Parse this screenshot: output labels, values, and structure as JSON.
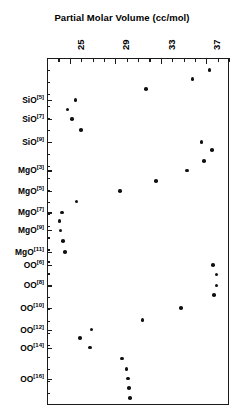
{
  "chart_data": {
    "type": "scatter",
    "title": "Partial Molar Volume (cc/mol)",
    "xlabel": "Partial Molar Volume (cc/mol)",
    "ylabel": "",
    "orientation": "horizontal",
    "xlim": [
      23,
      39
    ],
    "xticks": [
      25,
      29,
      33,
      37
    ],
    "xtick_labels": [
      "25",
      "29",
      "33",
      "37"
    ],
    "xminor_step": 1,
    "grid": false,
    "legend": null,
    "axis_title_position": "top",
    "categories": [
      "SiO[5]",
      "SiO[7]",
      "SiO[9]",
      "MgO[3]",
      "MgO[5]",
      "MgO[7]",
      "MgO[9]",
      "MgO[11]",
      "OO[6]",
      "OO[8]",
      "OO[10]",
      "OO[12]",
      "OO[14]",
      "OO[16]"
    ],
    "category_labels": [
      {
        "base": "SiO",
        "sup": "[5]"
      },
      {
        "base": "SiO",
        "sup": "[7]"
      },
      {
        "base": "SiO",
        "sup": "[9]"
      },
      {
        "base": "MgO",
        "sup": "[3]"
      },
      {
        "base": "MgO",
        "sup": "[5]"
      },
      {
        "base": "MgO",
        "sup": "[7]"
      },
      {
        "base": "MgO",
        "sup": "[9]"
      },
      {
        "base": "MgO",
        "sup": "[11]"
      },
      {
        "base": "OO",
        "sup": "[6]"
      },
      {
        "base": "OO",
        "sup": "[8]"
      },
      {
        "base": "OO",
        "sup": "[10]"
      },
      {
        "base": "OO",
        "sup": "[12]"
      },
      {
        "base": "OO",
        "sup": "[14]"
      },
      {
        "base": "OO",
        "sup": "[16]"
      }
    ],
    "points": [
      {
        "category": "",
        "row": 0,
        "value": 37.3
      },
      {
        "category": "",
        "row": 0.75,
        "value": 35.8
      },
      {
        "category": "",
        "row": 1.6,
        "value": 31.7
      },
      {
        "category": "SiO[5]",
        "row": 2.5,
        "value": 25.5
      },
      {
        "category": "",
        "row": 3.3,
        "value": 24.8
      },
      {
        "category": "SiO[7]",
        "row": 4.1,
        "value": 25.2
      },
      {
        "category": "",
        "row": 5.0,
        "value": 26.0
      },
      {
        "category": "SiO[9]",
        "row": 6.0,
        "value": 36.6
      },
      {
        "category": "",
        "row": 6.7,
        "value": 37.5
      },
      {
        "category": "",
        "row": 7.6,
        "value": 36.8
      },
      {
        "category": "MgO[3]",
        "row": 8.4,
        "value": 35.3
      },
      {
        "category": "",
        "row": 9.3,
        "value": 32.6
      },
      {
        "category": "MgO[5]",
        "row": 10.1,
        "value": 29.4
      },
      {
        "category": "",
        "row": 11.0,
        "value": 25.6
      },
      {
        "category": "MgO[7]",
        "row": 11.9,
        "value": 24.3
      },
      {
        "category": "",
        "row": 12.6,
        "value": 24.1
      },
      {
        "category": "MgO[9]",
        "row": 13.4,
        "value": 24.2
      },
      {
        "category": "",
        "row": 14.3,
        "value": 24.4
      },
      {
        "category": "MgO[11]",
        "row": 15.2,
        "value": 24.6
      },
      {
        "category": "OO[6]",
        "row": 16.3,
        "value": 37.6
      },
      {
        "category": "",
        "row": 17.1,
        "value": 37.9
      },
      {
        "category": "OO[8]",
        "row": 18.0,
        "value": 37.9
      },
      {
        "category": "",
        "row": 18.8,
        "value": 37.7
      },
      {
        "category": "OO[10]",
        "row": 19.9,
        "value": 34.8
      },
      {
        "category": "",
        "row": 20.9,
        "value": 31.4
      },
      {
        "category": "OO[12]",
        "row": 21.7,
        "value": 26.9
      },
      {
        "category": "",
        "row": 22.4,
        "value": 25.9
      },
      {
        "category": "OO[14]",
        "row": 23.2,
        "value": 26.8
      },
      {
        "category": "",
        "row": 24.1,
        "value": 29.6
      },
      {
        "category": "",
        "row": 25.0,
        "value": 30.0
      },
      {
        "category": "OO[16]",
        "row": 25.8,
        "value": 30.1
      },
      {
        "category": "",
        "row": 26.6,
        "value": 30.2
      },
      {
        "category": "",
        "row": 27.4,
        "value": 30.3
      }
    ],
    "marker": {
      "shape": "circle",
      "color": "#111111",
      "size": 3.6
    }
  },
  "axis": {
    "frame_color": "#1a1a1a",
    "tick_color": "#1a1a1a",
    "background": "#ffffff"
  }
}
